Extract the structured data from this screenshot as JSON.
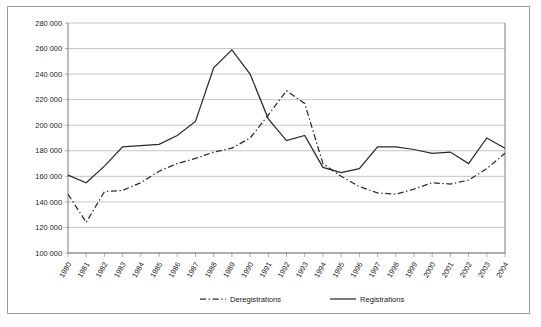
{
  "chart_data": {
    "type": "line",
    "title": "",
    "xlabel": "",
    "ylabel": "",
    "categories": [
      "1980",
      "1981",
      "1982",
      "1983",
      "1984",
      "1985",
      "1986",
      "1987",
      "1988",
      "1989",
      "1990",
      "1991",
      "1992",
      "1993",
      "1994",
      "1995",
      "1996",
      "1997",
      "1998",
      "1999",
      "2000",
      "2001",
      "2002",
      "2003",
      "2004"
    ],
    "series": [
      {
        "name": "Deregistrations",
        "style": "dash-dot",
        "color": "#2b2b2b",
        "values": [
          146000,
          124000,
          148000,
          149000,
          155000,
          164000,
          170000,
          174000,
          179000,
          182000,
          190000,
          208000,
          227000,
          217000,
          170000,
          160000,
          152000,
          147000,
          146000,
          150000,
          155000,
          154000,
          157000,
          166000,
          178000
        ]
      },
      {
        "name": "Registrations",
        "style": "solid",
        "color": "#2b2b2b",
        "values": [
          161000,
          155000,
          168000,
          183000,
          184000,
          185000,
          192000,
          203000,
          245000,
          259000,
          240000,
          205000,
          188000,
          192000,
          167000,
          163000,
          166000,
          183000,
          183000,
          181000,
          178000,
          179000,
          170000,
          190000,
          182000
        ]
      }
    ],
    "ylim": [
      100000,
      280000
    ],
    "ytick_step": 20000,
    "ytick_labels": [
      "280 000",
      "260 000",
      "240 000",
      "220 000",
      "200 000",
      "180 000",
      "160 000",
      "140 000",
      "120 000",
      "100 000"
    ],
    "ytick_values": [
      280000,
      260000,
      240000,
      220000,
      200000,
      180000,
      160000,
      140000,
      120000,
      100000
    ],
    "grid": true,
    "legend_position": "bottom",
    "xlabel_rotation": -60
  },
  "legend": {
    "entries": [
      {
        "label": "Deregistrations",
        "style": "dash-dot"
      },
      {
        "label": "Registrations",
        "style": "solid"
      }
    ]
  }
}
